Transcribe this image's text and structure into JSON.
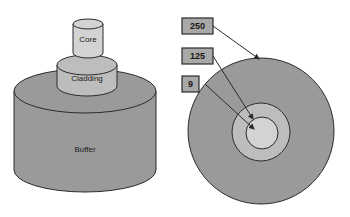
{
  "figure": {
    "colors": {
      "core": "#d3d3d3",
      "cladding": "#bdbdbd",
      "buffer": "#9a9a9a",
      "outline": "#2b2b2b",
      "callout_fill": "#a8a8a8",
      "callout_border": "#2b2b2b",
      "background": "#ffffff",
      "arrow": "#2b2b2b",
      "text": "#1a1a1a"
    }
  },
  "left_diagram": {
    "name": "stacked-cylinders",
    "layers": [
      {
        "id": "core",
        "label": "Core"
      },
      {
        "id": "cladding",
        "label": "Cladding"
      },
      {
        "id": "buffer",
        "label": "Buffer"
      }
    ]
  },
  "right_diagram": {
    "name": "cross-section",
    "callouts": [
      {
        "id": "buffer-callout",
        "value": "250",
        "target": "buffer"
      },
      {
        "id": "cladding-callout",
        "value": "125",
        "target": "cladding"
      },
      {
        "id": "core-callout",
        "value": "9",
        "target": "core"
      }
    ],
    "rings": [
      {
        "id": "buffer",
        "label": "250"
      },
      {
        "id": "cladding",
        "label": "125"
      },
      {
        "id": "core",
        "label": "9"
      }
    ]
  }
}
